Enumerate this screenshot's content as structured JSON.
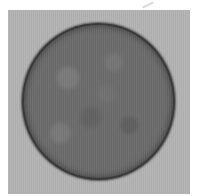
{
  "image": {
    "description": "grayscale micrograph of a single round cell with granular texture on a light gray background",
    "colors": {
      "background": "#b3b3b3",
      "cell_fill": "#6b6b6b",
      "cell_edge": "#3a3a3a",
      "margin": "#ffffff"
    }
  }
}
